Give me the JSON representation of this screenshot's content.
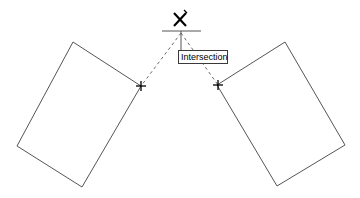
{
  "scene": {
    "title": "Intersection object snap illustration",
    "background_color": "#ffffff",
    "geometry_color": "#555555",
    "tracking_color": "#6b6b6b",
    "marker_color": "#000000",
    "width": 360,
    "height": 198
  },
  "tooltip": {
    "label": "Intersection",
    "x": 178,
    "y": 50,
    "width": 50,
    "height": 14,
    "border_color": "#3a3a3a",
    "background_color": "#ffffff",
    "text_color": "#000000"
  },
  "snap_marker": {
    "name": "intersection-snap-marker",
    "glyph": "X",
    "x": 181,
    "y": 19,
    "color": "#000000"
  },
  "alignment_line": {
    "x1": 162,
    "y1": 31,
    "x2": 201,
    "y2": 31,
    "color": "#555555"
  },
  "leader_line": {
    "x1": 181,
    "y1": 31,
    "x2": 181,
    "y2": 50,
    "color": "#555555"
  },
  "tracking_lines": [
    {
      "name": "tracking-line-left",
      "x1": 181,
      "y1": 33,
      "x2": 141,
      "y2": 86,
      "color": "#6b6b6b",
      "dash": "3 3"
    },
    {
      "name": "tracking-line-right",
      "x1": 181,
      "y1": 33,
      "x2": 218,
      "y2": 85,
      "color": "#6b6b6b",
      "dash": "3 3"
    }
  ],
  "shapes": [
    {
      "name": "rectangle-left",
      "points": "73,42 141,86 82,187 17,146",
      "stroke": "#555555"
    },
    {
      "name": "rectangle-right",
      "points": "285,42 345,145 277,186 217,85",
      "stroke": "#555555"
    }
  ],
  "endpoint_markers": [
    {
      "name": "endpoint-marker-left",
      "x": 141,
      "y": 86,
      "size": 4,
      "color": "#000000"
    },
    {
      "name": "endpoint-marker-right",
      "x": 218,
      "y": 85,
      "size": 4,
      "color": "#000000"
    }
  ]
}
